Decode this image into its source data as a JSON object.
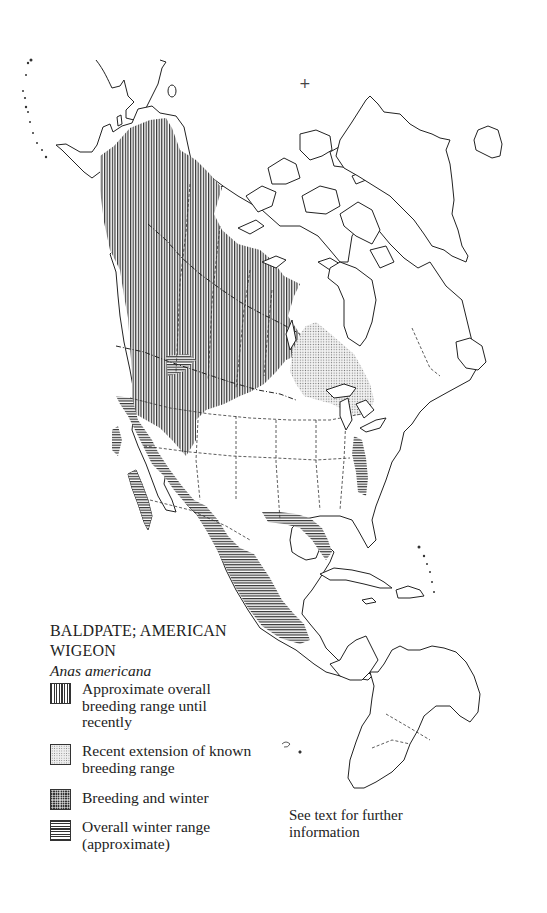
{
  "map": {
    "title_line1": "BALDPATE; AMERICAN",
    "title_line2": "WIGEON",
    "scientific_name": "Anas americana",
    "north_pole_marker": "+",
    "region": "North America, Central America, Caribbean, northern South America",
    "pattern_colors": {
      "ink": "#333333",
      "paper": "#ffffff",
      "stipple": "#777777"
    }
  },
  "legend": {
    "items": [
      {
        "key": "breeding-range",
        "pattern": "vertical-lines",
        "label_lines": [
          "Approximate overall",
          "breeding range until",
          "recently"
        ]
      },
      {
        "key": "recent-extension",
        "pattern": "stipple",
        "label_lines": [
          "Recent extension of known",
          "breeding range"
        ]
      },
      {
        "key": "breeding-and-winter",
        "pattern": "cross-hatch",
        "label_lines": [
          "Breeding and winter"
        ]
      },
      {
        "key": "winter-range",
        "pattern": "horizontal-lines",
        "label_lines": [
          "Overall winter range",
          "(approximate)"
        ]
      }
    ]
  },
  "note": {
    "line1": "See text for further",
    "line2": "information"
  }
}
